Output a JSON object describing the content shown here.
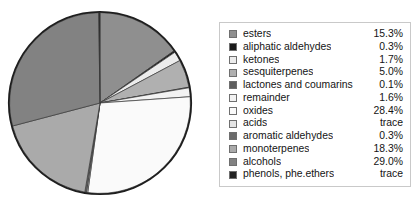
{
  "chart_data": {
    "type": "pie",
    "title": "",
    "subtitle": "",
    "xlabel": "",
    "ylabel": "",
    "legend_position": "right",
    "grid": false,
    "units": "percent",
    "start_angle_deg": 0,
    "direction": "clockwise",
    "categories": [
      "esters",
      "aliphatic aldehydes",
      "ketones",
      "sesquiterpenes",
      "lactones and coumarins",
      "remainder",
      "oxides",
      "acids",
      "aromatic aldehydes",
      "monoterpenes",
      "alcohols",
      "phenols, phe.ethers"
    ],
    "values": [
      15.3,
      0.3,
      1.7,
      5.0,
      0.1,
      1.6,
      28.4,
      0.0,
      0.3,
      18.3,
      29.0,
      0.0
    ],
    "value_labels": [
      "15.3%",
      "0.3%",
      "1.7%",
      "5.0%",
      "0.1%",
      "1.6%",
      "28.4%",
      "trace",
      "0.3%",
      "18.3%",
      "29.0%",
      "trace"
    ],
    "colors": [
      "#8f8f8f",
      "#1a1a1a",
      "#ececec",
      "#b0b0b0",
      "#5e5e5e",
      "#f2f2f2",
      "#fafafa",
      "#e4e4e4",
      "#6b6b6b",
      "#aaaaaa",
      "#828282",
      "#232323"
    ],
    "slice_outline_color": "#3a3a3a",
    "pie_outline_color": "#1e1e1e"
  },
  "legend": {
    "rows": [
      {
        "label": "esters",
        "value": "15.3%",
        "color": "#8f8f8f"
      },
      {
        "label": "aliphatic aldehydes",
        "value": "0.3%",
        "color": "#1a1a1a"
      },
      {
        "label": "ketones",
        "value": "1.7%",
        "color": "#ececec"
      },
      {
        "label": "sesquiterpenes",
        "value": "5.0%",
        "color": "#b0b0b0"
      },
      {
        "label": "lactones and coumarins",
        "value": "0.1%",
        "color": "#5e5e5e"
      },
      {
        "label": "remainder",
        "value": "1.6%",
        "color": "#f2f2f2"
      },
      {
        "label": "oxides",
        "value": "28.4%",
        "color": "#fafafa"
      },
      {
        "label": "acids",
        "value": "trace",
        "color": "#e4e4e4"
      },
      {
        "label": "aromatic aldehydes",
        "value": "0.3%",
        "color": "#6b6b6b"
      },
      {
        "label": "monoterpenes",
        "value": "18.3%",
        "color": "#aaaaaa"
      },
      {
        "label": "alcohols",
        "value": "29.0%",
        "color": "#828282"
      },
      {
        "label": "phenols, phe.ethers",
        "value": "trace",
        "color": "#232323"
      }
    ]
  }
}
